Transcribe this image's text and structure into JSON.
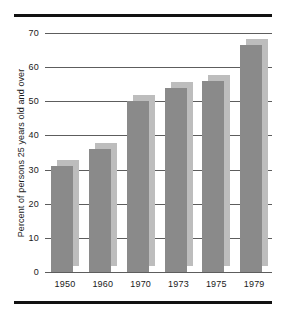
{
  "chart_data": {
    "type": "bar",
    "title": "",
    "subtitle": "",
    "xlabel": "",
    "ylabel": "Percent of persons 25 years old and over",
    "categories": [
      "1950",
      "1960",
      "1970",
      "1973",
      "1975",
      "1979"
    ],
    "values": [
      31,
      36,
      50,
      54,
      56,
      66.5
    ],
    "ylim": [
      0,
      70
    ],
    "yticks": [
      0,
      10,
      20,
      30,
      40,
      50,
      60,
      70
    ],
    "ytick_labels": [
      "0",
      "10",
      "20",
      "30",
      "40",
      "50",
      "60",
      "70"
    ],
    "grid": true,
    "legend": "none",
    "series": [
      {
        "name": "Percent of persons 25 years old and over",
        "values": [
          31,
          36,
          50,
          54,
          56,
          66.5
        ]
      }
    ],
    "bar_style": "3d-offset",
    "colors": {
      "bar_front": "#8a8a8a",
      "bar_shadow": "#bdbdbd",
      "gridline": "#5d5d5d",
      "rule": "#111111",
      "text": "#1a1a1a",
      "background": "#ffffff"
    }
  }
}
